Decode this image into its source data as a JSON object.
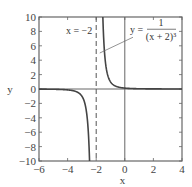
{
  "chart_data": {
    "type": "line",
    "title": "",
    "xlabel": "x",
    "ylabel": "y",
    "xlim": [
      -6,
      4
    ],
    "ylim": [
      -10,
      10
    ],
    "xticks": [
      -6,
      -4,
      -2,
      0,
      2,
      4
    ],
    "yticks": [
      -10,
      -8,
      -6,
      -4,
      -2,
      0,
      2,
      4,
      6,
      8,
      10
    ],
    "xtick_labels": [
      "−6",
      "−4",
      "−2",
      "0",
      "2",
      "4"
    ],
    "ytick_labels": [
      "−10",
      "−8",
      "−6",
      "−4",
      "−2",
      "0",
      "2",
      "4",
      "6",
      "8",
      "10"
    ],
    "grid": false,
    "legend": null,
    "series": [
      {
        "name": "y = 1/(x+2)^3",
        "function": "1/(x+2)^3",
        "style": "solid",
        "x": [
          -6,
          -5,
          -4,
          -3,
          -2.5,
          -2.4646
        ],
        "y": [
          -0.0156,
          -0.037,
          -0.125,
          -1,
          -8,
          -10
        ]
      },
      {
        "name": "y = 1/(x+2)^3 (right branch)",
        "function": "1/(x+2)^3",
        "style": "solid",
        "x": [
          -1.5359,
          -1.5,
          -1,
          0,
          2,
          4
        ],
        "y": [
          10,
          8,
          1,
          0.125,
          0.0156,
          0.0046
        ]
      }
    ],
    "asymptotes": [
      {
        "type": "vertical",
        "x": -2,
        "style": "dashed",
        "label": "x = −2"
      },
      {
        "type": "horizontal",
        "y": 0,
        "style": "solid"
      }
    ],
    "reference_lines": [
      {
        "type": "vertical",
        "x": 0,
        "style": "solid"
      }
    ],
    "annotations": [
      {
        "text": "x = −2",
        "x": -3.2,
        "y": 8
      },
      {
        "text": "y = 1/(x + 2)^3",
        "numerator": "1",
        "denominator": "(x + 2)³",
        "x": 1.6,
        "y": 8.2,
        "arrow_to": [
          -1.75,
          5
        ]
      }
    ]
  },
  "labels": {
    "xlabel": "x",
    "ylabel": "y",
    "asymptote_label": "x = −2",
    "func_lhs": "y =",
    "func_num": "1",
    "func_den": "(x + 2)³"
  }
}
